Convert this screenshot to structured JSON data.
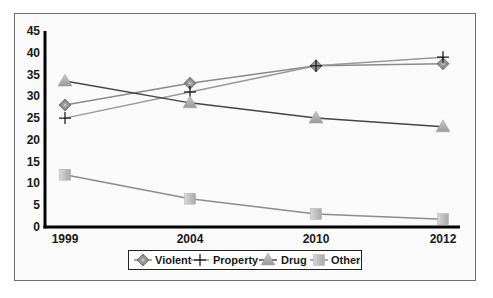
{
  "chart_data": {
    "type": "line",
    "title": "",
    "xlabel": "",
    "ylabel": "",
    "categories": [
      "1999",
      "2004",
      "2010",
      "2012"
    ],
    "ylim": [
      0,
      45
    ],
    "yticks": [
      0,
      5,
      10,
      15,
      20,
      25,
      30,
      35,
      40,
      45
    ],
    "grid": false,
    "legend_position": "bottom",
    "series": [
      {
        "name": "Violent",
        "marker": "diamond",
        "color": "#8a8a8a",
        "values": [
          28,
          33,
          37,
          37.5
        ]
      },
      {
        "name": "Property",
        "marker": "plus",
        "color": "#999999",
        "values": [
          25,
          31,
          37,
          39
        ]
      },
      {
        "name": "Drug",
        "marker": "triangle",
        "color": "#444444",
        "values": [
          33.5,
          28.5,
          25,
          23
        ]
      },
      {
        "name": "Other",
        "marker": "square",
        "color": "#8c8c8c",
        "values": [
          12,
          6.5,
          3,
          1.8
        ]
      }
    ]
  }
}
